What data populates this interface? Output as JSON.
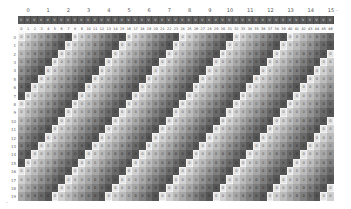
{
  "group_labels": [
    "0",
    "1",
    "2",
    "3",
    "4",
    "5",
    "6",
    "7",
    "8",
    "9",
    "10",
    "11",
    "12",
    "13",
    "14",
    "15"
  ],
  "header_band": {
    "glyph": "V",
    "color": "#595959",
    "text_color": "#d8d8d8"
  },
  "columns": 47,
  "column_labels_start": 0,
  "rows": 20,
  "row_labels_start": 0,
  "band_period": 8,
  "band_start_col_row0": 8,
  "band_shift_per_row": 1,
  "cell_value": "0",
  "shade_light": "#e4e4e4",
  "shade_dark": "#555555",
  "bottom_marker": "-",
  "end_marker": "-"
}
